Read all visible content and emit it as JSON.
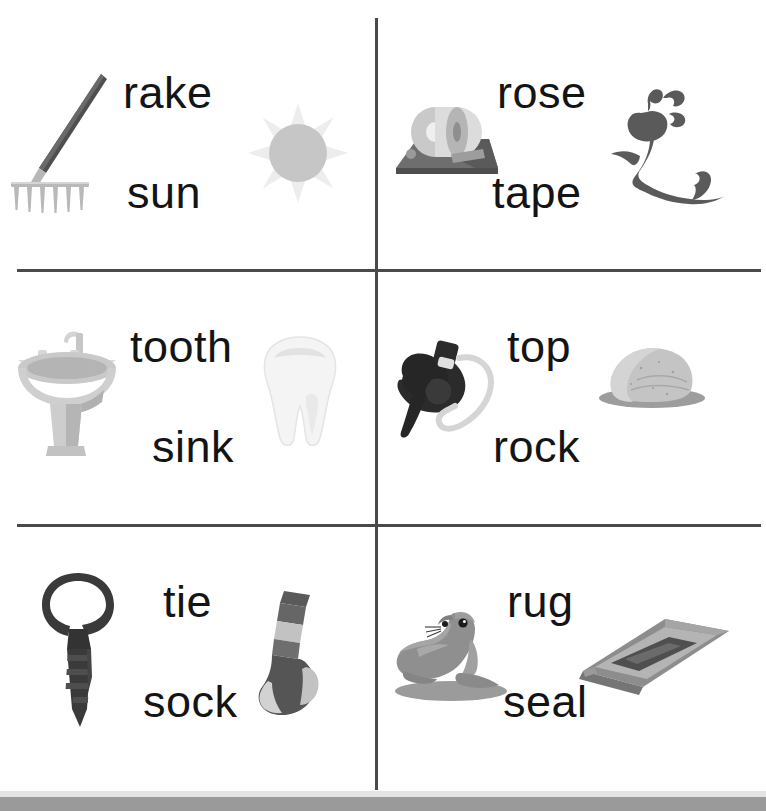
{
  "worksheet": {
    "layout": {
      "columns": 2,
      "rows": 3
    },
    "colors": {
      "rule": "#4a4a4a",
      "word_text": "#141414",
      "page_background": "#ffffff",
      "bottom_band": "#9a9a9a",
      "dark_art": "#4b4b4b",
      "black_art": "#2b2b2b",
      "mid_gray_art": "#8d8d8d",
      "light_gray_art": "#c9c9c9",
      "pale_gray_art": "#e6e6e6"
    },
    "cells": [
      {
        "id": "cell-1",
        "row": 1,
        "column": 1,
        "word_top": "rake",
        "word_bottom": "sun",
        "picture_left": "rake",
        "picture_right": "sun"
      },
      {
        "id": "cell-2",
        "row": 1,
        "column": 2,
        "word_top": "rose",
        "word_bottom": "tape",
        "picture_left": "tape-dispenser",
        "picture_right": "rose"
      },
      {
        "id": "cell-3",
        "row": 2,
        "column": 1,
        "word_top": "tooth",
        "word_bottom": "sink",
        "picture_left": "sink",
        "picture_right": "tooth"
      },
      {
        "id": "cell-4",
        "row": 2,
        "column": 2,
        "word_top": "top",
        "word_bottom": "rock",
        "picture_left": "spinning-top",
        "picture_right": "rock"
      },
      {
        "id": "cell-5",
        "row": 3,
        "column": 1,
        "word_top": "tie",
        "word_bottom": "sock",
        "picture_left": "necktie",
        "picture_right": "sock"
      },
      {
        "id": "cell-6",
        "row": 3,
        "column": 2,
        "word_top": "rug",
        "word_bottom": "seal",
        "picture_left": "seal",
        "picture_right": "rug"
      }
    ]
  }
}
